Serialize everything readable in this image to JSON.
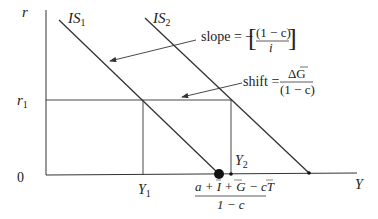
{
  "diagram": {
    "axes": {
      "y_label": "r",
      "x_label": "Y",
      "origin_label": "0",
      "r1_label": "r",
      "r1_sub": "1",
      "y1_label": "Y",
      "y1_sub": "1",
      "y2_label": "Y",
      "y2_sub": "2"
    },
    "curves": [
      {
        "name": "IS",
        "sub": "1"
      },
      {
        "name": "IS",
        "sub": "2"
      }
    ],
    "annotations": {
      "slope_prefix": "slope = −",
      "slope_num": "(1 − c)",
      "slope_den": "i",
      "shift_prefix": "shift =",
      "shift_num": "ΔG",
      "shift_den": "(1 − c)",
      "intercept_num": "a + I + G − cT",
      "intercept_den": "1 − c"
    },
    "colors": {
      "line": "#333333",
      "text": "#222222",
      "background": "#ffffff"
    }
  }
}
